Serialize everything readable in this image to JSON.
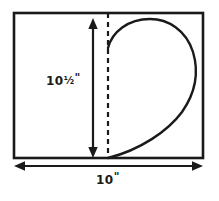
{
  "diagram": {
    "background_color": "#ffffff",
    "line_color": "#1a1a1a",
    "labels": {
      "height": "10½\"",
      "height_whole": "10",
      "height_fraction": "½",
      "height_unit": "\"",
      "width": "10\"",
      "width_whole": "10",
      "width_unit": "\""
    },
    "shapes": {
      "rectangle": {
        "name": "fabric-rectangle",
        "x": 14,
        "y": 13,
        "width": 189,
        "height": 145,
        "stroke_width": 2.6
      },
      "fold_line": {
        "name": "dashed-fold-line",
        "x": 108,
        "y_top": 13,
        "y_bottom": 158,
        "dash": "5 4",
        "stroke_width": 2.2
      },
      "half_heart": {
        "name": "half-heart-curve",
        "start": [
          108,
          48
        ],
        "apex": [
          155,
          19
        ],
        "right_bulge": [
          196,
          78
        ],
        "tip": [
          108,
          158
        ],
        "stroke_width": 2.4
      },
      "height_arrow": {
        "name": "height-dimension-arrow",
        "x": 93,
        "y_top": 21,
        "y_bottom": 156,
        "stroke_width": 2.2,
        "arrowheads": "both"
      },
      "width_arrow": {
        "name": "width-dimension-arrow",
        "y": 166,
        "x_left": 15,
        "x_right": 202,
        "stroke_width": 2.2,
        "arrowheads": "both"
      }
    }
  }
}
